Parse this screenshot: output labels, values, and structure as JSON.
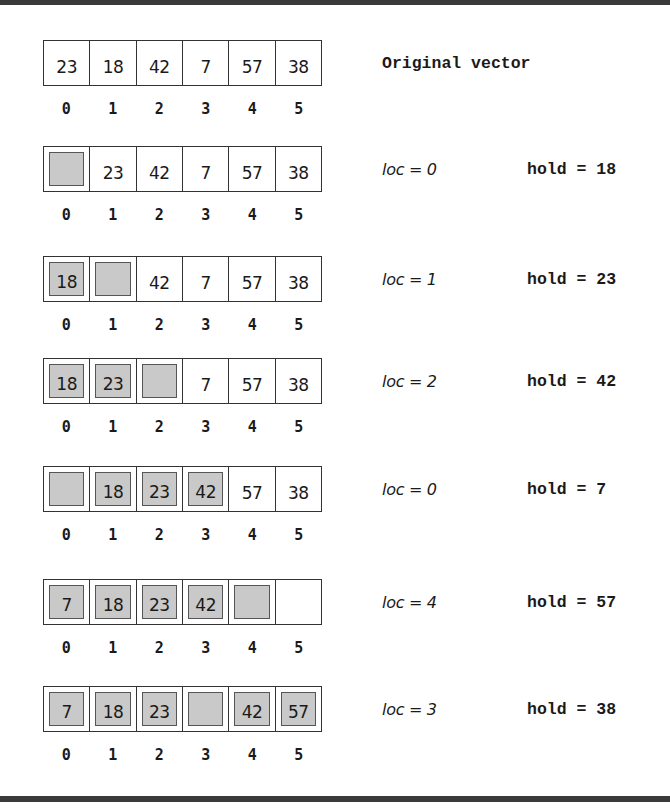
{
  "diagram": {
    "title": "Original vector",
    "rows": [
      {
        "label": "Original vector",
        "cells": [
          {
            "value": "23",
            "shaded": false
          },
          {
            "value": "18",
            "shaded": false
          },
          {
            "value": "42",
            "shaded": false
          },
          {
            "value": "7",
            "shaded": false
          },
          {
            "value": "57",
            "shaded": false
          },
          {
            "value": "38",
            "shaded": false
          }
        ],
        "indices": [
          "0",
          "1",
          "2",
          "3",
          "4",
          "5"
        ],
        "loc": "",
        "hold": ""
      },
      {
        "cells": [
          {
            "value": "",
            "shaded": true
          },
          {
            "value": "23",
            "shaded": false
          },
          {
            "value": "42",
            "shaded": false
          },
          {
            "value": "7",
            "shaded": false
          },
          {
            "value": "57",
            "shaded": false
          },
          {
            "value": "38",
            "shaded": false
          }
        ],
        "indices": [
          "0",
          "1",
          "2",
          "3",
          "4",
          "5"
        ],
        "loc": "loc = 0",
        "hold": "hold = 18"
      },
      {
        "cells": [
          {
            "value": "18",
            "shaded": true
          },
          {
            "value": "",
            "shaded": true
          },
          {
            "value": "42",
            "shaded": false
          },
          {
            "value": "7",
            "shaded": false
          },
          {
            "value": "57",
            "shaded": false
          },
          {
            "value": "38",
            "shaded": false
          }
        ],
        "indices": [
          "0",
          "1",
          "2",
          "3",
          "4",
          "5"
        ],
        "loc": "loc = 1",
        "hold": "hold = 23"
      },
      {
        "cells": [
          {
            "value": "18",
            "shaded": true
          },
          {
            "value": "23",
            "shaded": true
          },
          {
            "value": "",
            "shaded": true
          },
          {
            "value": "7",
            "shaded": false
          },
          {
            "value": "57",
            "shaded": false
          },
          {
            "value": "38",
            "shaded": false
          }
        ],
        "indices": [
          "0",
          "1",
          "2",
          "3",
          "4",
          "5"
        ],
        "loc": "loc = 2",
        "hold": "hold = 42"
      },
      {
        "cells": [
          {
            "value": "",
            "shaded": true
          },
          {
            "value": "18",
            "shaded": true
          },
          {
            "value": "23",
            "shaded": true
          },
          {
            "value": "42",
            "shaded": true
          },
          {
            "value": "57",
            "shaded": false
          },
          {
            "value": "38",
            "shaded": false
          }
        ],
        "indices": [
          "0",
          "1",
          "2",
          "3",
          "4",
          "5"
        ],
        "loc": "loc = 0",
        "hold": "hold = 7"
      },
      {
        "cells": [
          {
            "value": "7",
            "shaded": true
          },
          {
            "value": "18",
            "shaded": true
          },
          {
            "value": "23",
            "shaded": true
          },
          {
            "value": "42",
            "shaded": true
          },
          {
            "value": "",
            "shaded": true
          },
          {
            "value": "",
            "shaded": false
          }
        ],
        "indices": [
          "0",
          "1",
          "2",
          "3",
          "4",
          "5"
        ],
        "loc": "loc = 4",
        "hold": "hold = 57"
      },
      {
        "cells": [
          {
            "value": "7",
            "shaded": true
          },
          {
            "value": "18",
            "shaded": true
          },
          {
            "value": "23",
            "shaded": true
          },
          {
            "value": "",
            "shaded": true
          },
          {
            "value": "42",
            "shaded": true
          },
          {
            "value": "57",
            "shaded": true
          }
        ],
        "indices": [
          "0",
          "1",
          "2",
          "3",
          "4",
          "5"
        ],
        "loc": "loc = 3",
        "hold": "hold = 38"
      }
    ]
  },
  "colors": {
    "frame": "#3a3a3a",
    "shaded_cell": "#c9c9c9",
    "border": "#333333",
    "background": "#ffffff"
  }
}
